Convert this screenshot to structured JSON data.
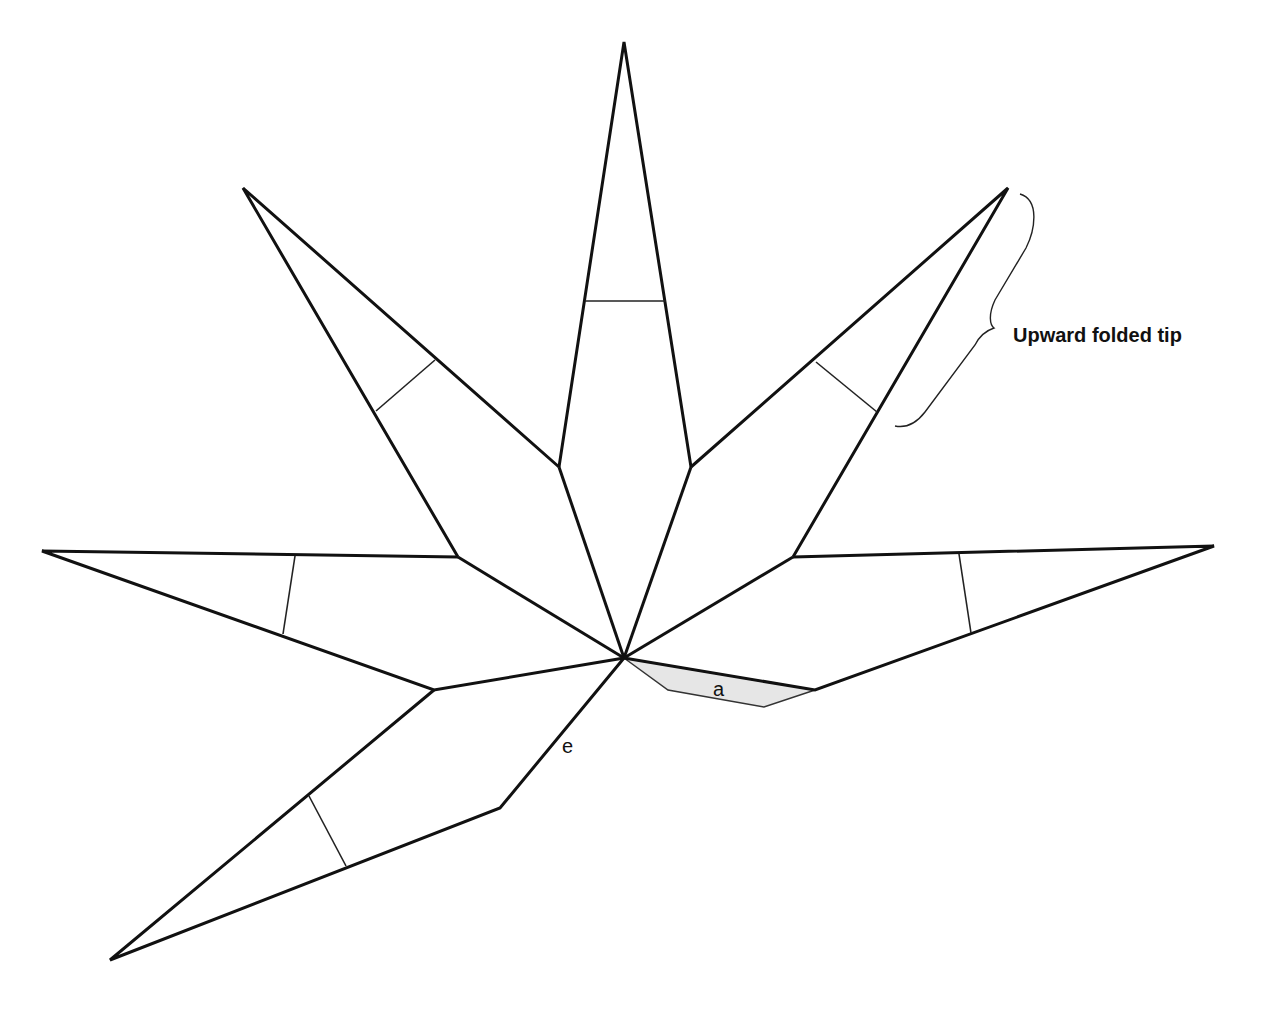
{
  "diagram": {
    "annotation": {
      "label": "Upward folded tip"
    },
    "region_labels": {
      "a": "a",
      "e": "e"
    },
    "colors": {
      "stroke": "#111111",
      "shaded_region": "#e6e6e6",
      "background": "#ffffff"
    }
  }
}
